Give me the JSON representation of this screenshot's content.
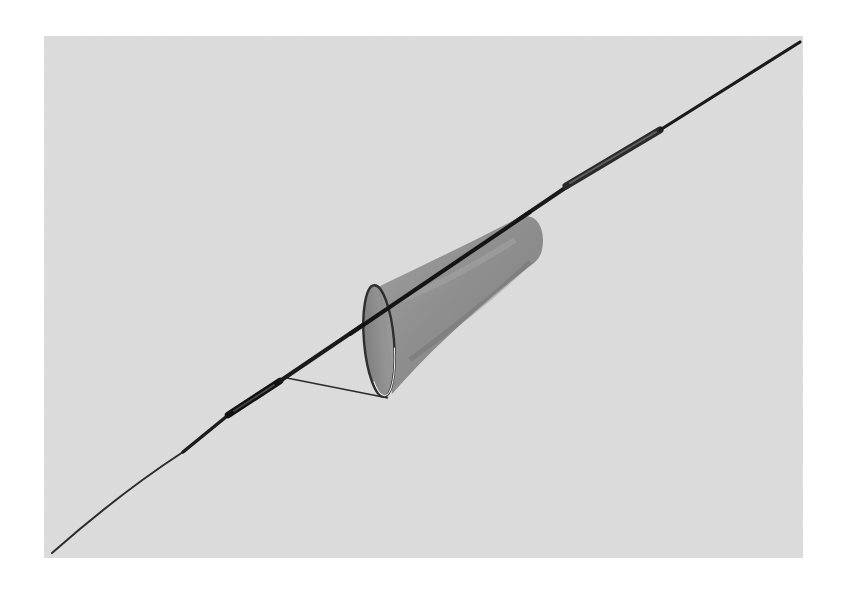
{
  "image": {
    "subject": "insect net on long telescoping pole",
    "description": "Product photograph of a cone-shaped mesh sweep net mounted diagonally on a long thin rod with two ferrule joints, shown against a light gray backdrop.",
    "alt_text": "Insect sweep net on a long pole"
  },
  "colors": {
    "page_background": "#ffffff",
    "backdrop": "#dadada",
    "pole": "#1a1a1a",
    "net_mesh": "#8c8c8c",
    "net_shadow": "#6e6e6e",
    "hoop_rim": "#f2f2f2"
  },
  "geometry": {
    "frame": {
      "x": 44,
      "y": 36,
      "width": 759,
      "height": 522
    },
    "pole_start": {
      "x": 52,
      "y": 553
    },
    "pole_end": {
      "x": 800,
      "y": 42
    },
    "hoop_center": {
      "x": 379,
      "y": 341
    },
    "net_tail": {
      "x": 532,
      "y": 240
    }
  }
}
